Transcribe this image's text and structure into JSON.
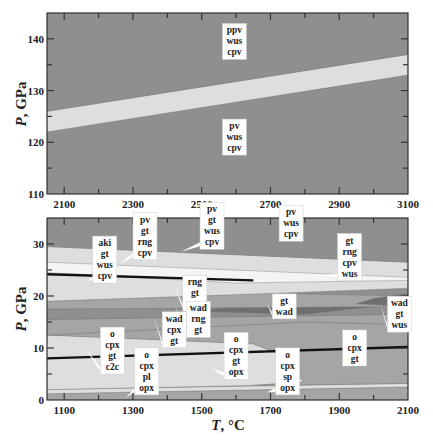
{
  "colors": {
    "dark_field": "#8f8f8f",
    "mid_field": "#a5a5a5",
    "light_field": "#dedede",
    "white_field": "#f4f4f4",
    "darkest_field": "#6f6f6f",
    "boundary_line": "#111111",
    "label_background": "#ffffff"
  },
  "chart_data": [
    {
      "type": "area",
      "panel": "top",
      "title": "",
      "xlabel": "",
      "ylabel": "P, GPa",
      "xlim": [
        2050,
        3100
      ],
      "ylim": [
        110,
        145
      ],
      "x_ticks": [
        2100,
        2300,
        2500,
        2700,
        2900,
        3100
      ],
      "x_tick_labels": [
        "2100",
        "2300",
        "2500",
        "2700",
        "2900",
        "3100"
      ],
      "y_ticks": [
        110,
        120,
        130,
        140
      ],
      "y_tick_labels": [
        "110",
        "120",
        "130",
        "140"
      ],
      "grid": false,
      "regions": [
        {
          "name": "pv-wus-cpv",
          "fill": "dark_field",
          "polygon": [
            [
              2050,
              110
            ],
            [
              3100,
              110
            ],
            [
              3100,
              133
            ],
            [
              2050,
              122
            ]
          ]
        },
        {
          "name": "transition",
          "fill": "light_field",
          "polygon": [
            [
              2050,
              122
            ],
            [
              3100,
              133
            ],
            [
              3100,
              137
            ],
            [
              2050,
              126
            ]
          ]
        },
        {
          "name": "ppv-wus-cpv",
          "fill": "dark_field",
          "polygon": [
            [
              2050,
              126
            ],
            [
              3100,
              137
            ],
            [
              3100,
              145
            ],
            [
              2050,
              145
            ]
          ]
        }
      ],
      "labels": [
        {
          "lines": [
            "ppv",
            "wus",
            "cpv"
          ],
          "x": 2595,
          "y": 139.5
        },
        {
          "lines": [
            "pv",
            "wus",
            "cpv"
          ],
          "x": 2595,
          "y": 121
        }
      ]
    },
    {
      "type": "area",
      "panel": "bottom",
      "title": "",
      "xlabel": "T, °C",
      "ylabel": "P, GPa",
      "xlim": [
        1050,
        2100
      ],
      "ylim": [
        0,
        35
      ],
      "x_ticks": [
        1100,
        1300,
        1500,
        1700,
        1900,
        2100
      ],
      "x_tick_labels": [
        "1100",
        "1300",
        "1500",
        "1700",
        "1900",
        "2100"
      ],
      "y_ticks": [
        0,
        10,
        20,
        30
      ],
      "y_tick_labels": [
        "0",
        "10",
        "20",
        "30"
      ],
      "grid": false,
      "regions": [
        {
          "name": "low-p-band",
          "fill": "mid_field",
          "polygon": [
            [
              1050,
              0
            ],
            [
              2100,
              0
            ],
            [
              2100,
              2.5
            ],
            [
              1050,
              1.2
            ]
          ]
        },
        {
          "name": "o-cpx-pl-opx",
          "fill": "light_field",
          "polygon": [
            [
              1050,
              1.2
            ],
            [
              2100,
              2.5
            ],
            [
              2100,
              3.2
            ],
            [
              1050,
              2.0
            ]
          ]
        },
        {
          "name": "o-cpx-gt-c2c",
          "fill": "light_field",
          "polygon": [
            [
              1050,
              2.0
            ],
            [
              1650,
              2.8
            ],
            [
              1800,
              3.5
            ],
            [
              1750,
              6
            ],
            [
              1720,
              9
            ],
            [
              1650,
              10.8
            ],
            [
              1050,
              12.5
            ]
          ]
        },
        {
          "name": "o-cpx-gt",
          "fill": "mid_field",
          "polygon": [
            [
              1650,
              2.8
            ],
            [
              2100,
              3.2
            ],
            [
              2100,
              14.5
            ],
            [
              1800,
              15
            ],
            [
              1500,
              14
            ],
            [
              1050,
              12.5
            ],
            [
              1650,
              10.8
            ],
            [
              1720,
              9
            ],
            [
              1750,
              6
            ],
            [
              1800,
              3.5
            ]
          ]
        },
        {
          "name": "wad-cpx-gt",
          "fill": "mid_field",
          "polygon": [
            [
              1050,
              12.5
            ],
            [
              1500,
              14
            ],
            [
              1800,
              15
            ],
            [
              2100,
              14.5
            ],
            [
              2100,
              16.5
            ],
            [
              1050,
              15.5
            ]
          ]
        },
        {
          "name": "wad-rng-gt",
          "fill": "dark_field",
          "polygon": [
            [
              1050,
              15.5
            ],
            [
              2100,
              16.5
            ],
            [
              2100,
              18
            ],
            [
              1050,
              17.5
            ]
          ]
        },
        {
          "name": "gt-wad",
          "fill": "darkest_field",
          "polygon": [
            [
              1500,
              17
            ],
            [
              1800,
              16.5
            ],
            [
              2000,
              18
            ],
            [
              1700,
              19.5
            ]
          ]
        },
        {
          "name": "rng-gt-cpv",
          "fill": "mid_field",
          "polygon": [
            [
              1050,
              17.5
            ],
            [
              2100,
              18
            ],
            [
              2100,
              20
            ],
            [
              1700,
              20.5
            ],
            [
              1050,
              19
            ]
          ]
        },
        {
          "name": "wad-gt-wus",
          "fill": "darkest_field",
          "polygon": [
            [
              1950,
              18.5
            ],
            [
              2100,
              18
            ],
            [
              2100,
              20.5
            ],
            [
              2000,
              19.5
            ]
          ]
        },
        {
          "name": "gt-rng-cpv-wus",
          "fill": "light_field",
          "polygon": [
            [
              1050,
              19
            ],
            [
              1700,
              20.5
            ],
            [
              2100,
              21.5
            ],
            [
              2100,
              26.5
            ],
            [
              1050,
              29.5
            ]
          ]
        },
        {
          "name": "aki-gt-wus-cpv",
          "fill": "white_field",
          "polygon": [
            [
              1050,
              24.5
            ],
            [
              1600,
              22.5
            ],
            [
              2100,
              23
            ],
            [
              2100,
              23.6
            ],
            [
              1050,
              26.5
            ]
          ]
        },
        {
          "name": "pv-gt-wus-cpv",
          "fill": "dark_field",
          "polygon": [
            [
              1050,
              29.5
            ],
            [
              2100,
              26.5
            ],
            [
              2100,
              35
            ],
            [
              1050,
              35
            ]
          ]
        }
      ],
      "boundary_lines": [
        {
          "name": "upper-dark-line",
          "points": [
            [
              1050,
              24.2
            ],
            [
              1650,
              23.0
            ]
          ]
        },
        {
          "name": "lower-dark-line",
          "points": [
            [
              1050,
              8.0
            ],
            [
              2100,
              10.2
            ]
          ]
        }
      ],
      "labels": [
        {
          "lines": [
            "aki",
            "gt",
            "wus",
            "cpv"
          ],
          "x": 1218,
          "y": 27,
          "pointer": [
            1170,
            23
          ]
        },
        {
          "lines": [
            "pv",
            "gt",
            "rng",
            "cpv"
          ],
          "x": 1335,
          "y": 31.5,
          "pointer": [
            1260,
            26
          ]
        },
        {
          "lines": [
            "pv",
            "gt",
            "wus",
            "cpv"
          ],
          "x": 1530,
          "y": 33.5,
          "pointer": [
            1440,
            28.5
          ]
        },
        {
          "lines": [
            "pv",
            "wus",
            "cpv"
          ],
          "x": 1760,
          "y": 34
        },
        {
          "lines": [
            "gt",
            "rng",
            "cpv",
            "wus"
          ],
          "x": 1930,
          "y": 27.5,
          "pointer": [
            1860,
            24
          ]
        },
        {
          "lines": [
            "rng",
            "gt",
            "cpv"
          ],
          "x": 1480,
          "y": 20.5,
          "pointer": [
            1420,
            22
          ]
        },
        {
          "lines": [
            "gt",
            "wad"
          ],
          "x": 1740,
          "y": 18,
          "pointer": [
            1690,
            18.5
          ]
        },
        {
          "lines": [
            "wad",
            "rng",
            "gt"
          ],
          "x": 1490,
          "y": 15.5,
          "pointer": [
            1420,
            18.5
          ]
        },
        {
          "lines": [
            "wad",
            "cpx",
            "gt"
          ],
          "x": 1420,
          "y": 13.5,
          "pointer": [
            1360,
            16
          ]
        },
        {
          "lines": [
            "wad",
            "gt",
            "wus"
          ],
          "x": 2075,
          "y": 16.5,
          "pointer": [
            2020,
            18.5
          ]
        },
        {
          "lines": [
            "o",
            "cpx",
            "gt",
            "c2c"
          ],
          "x": 1240,
          "y": 9.5,
          "pointer": [
            1160,
            10
          ]
        },
        {
          "lines": [
            "o",
            "cpx",
            "pl",
            "opx"
          ],
          "x": 1340,
          "y": 5.5,
          "pointer": [
            1280,
            0.5
          ]
        },
        {
          "lines": [
            "o",
            "cpx",
            "gt",
            "opx"
          ],
          "x": 1600,
          "y": 8.5,
          "pointer": [
            1530,
            6
          ]
        },
        {
          "lines": [
            "o",
            "cpx",
            "sp",
            "opx"
          ],
          "x": 1750,
          "y": 5.5,
          "pointer": [
            1690,
            1.5
          ]
        },
        {
          "lines": [
            "o",
            "cpx",
            "gt"
          ],
          "x": 1945,
          "y": 10
        }
      ]
    }
  ]
}
